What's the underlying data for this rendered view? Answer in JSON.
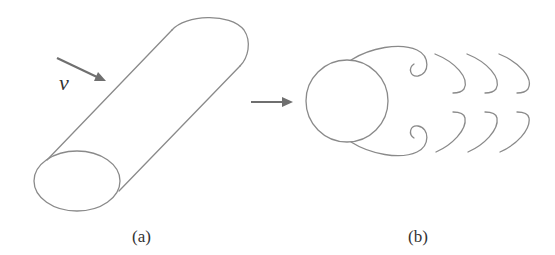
{
  "figure": {
    "panels": [
      {
        "id": "a",
        "caption": "(a)",
        "description": "Cylinder in cross-flow with velocity arrow",
        "velocity_label": "v"
      },
      {
        "id": "b",
        "caption": "(b)",
        "description": "Cross-section of cylinder with shed vortices (vortex street)"
      }
    ],
    "colors": {
      "line": "#8a8a8a",
      "arrow": "#6f6f6f",
      "text": "#333333"
    }
  }
}
